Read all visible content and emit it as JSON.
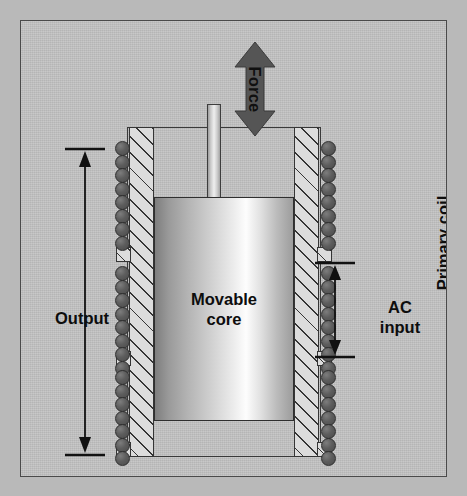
{
  "diagram": {
    "background_color": "#c3c3c3",
    "frame_border_color": "#4a4a4a"
  },
  "labels": {
    "force": "Force",
    "output": "Output",
    "ac_input_line1": "AC",
    "ac_input_line2": "input",
    "primary_coil": "Primary coil",
    "core_line1": "Movable",
    "core_line2": "core"
  },
  "colors": {
    "force_arrow": "#555555",
    "coil_winding": "#5a5a5a",
    "bobbin_hatch": "#353535",
    "core_highlight": "#fdfdfd",
    "outline": "#2f2f2f"
  },
  "components": {
    "coil_sections": [
      {
        "name": "secondary-upper",
        "circle_count": 8
      },
      {
        "name": "primary-middle",
        "circle_count": 8
      },
      {
        "name": "secondary-lower",
        "circle_count": 7
      }
    ]
  }
}
